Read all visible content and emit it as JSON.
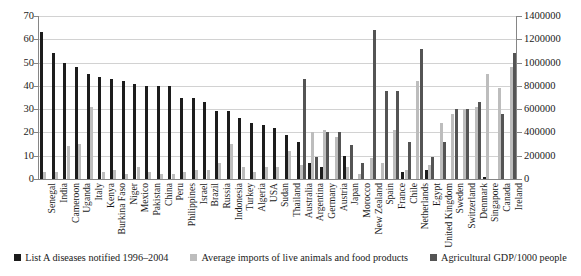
{
  "chart_data": {
    "type": "bar",
    "title": "",
    "xlabel": "",
    "ylabel": "",
    "ylabel_right": "",
    "grid": true,
    "legend_position": "bottom",
    "ylim": [
      0,
      70
    ],
    "ylim_right": [
      0,
      1400000
    ],
    "yticks": [
      "0",
      "10",
      "20",
      "30",
      "40",
      "50",
      "60",
      "70"
    ],
    "yticks_right": [
      "0",
      "200000",
      "400000",
      "600000",
      "800000",
      "1000000",
      "1200000",
      "1400000"
    ],
    "categories": [
      "Senegal",
      "India",
      "Cameroon",
      "Uganda",
      "Italy",
      "Kenya",
      "Burkina Faso",
      "Niger",
      "Mexico",
      "Pakistan",
      "China",
      "Peru",
      "Philippines",
      "Israel",
      "Brazil",
      "Russia",
      "Indonesia",
      "Turkey",
      "Algeria",
      "USA",
      "Sudan",
      "Thailand",
      "Australia",
      "Argentina",
      "Germany",
      "Austria",
      "Japan",
      "Morocco",
      "New Zealand",
      "Spain",
      "France",
      "Chile",
      "Netherlands",
      "Egypt",
      "United Kingdom",
      "Sweden",
      "Switzerland",
      "Denmark",
      "Singapore",
      "Canada",
      "Ireland"
    ],
    "series": [
      {
        "name": "List A diseases notified 1996–2004",
        "color": "#1c1c1c",
        "axis": "left",
        "values": [
          63,
          54,
          50,
          48,
          45,
          44,
          43,
          42,
          41,
          40,
          40,
          40,
          35,
          35,
          33,
          29,
          29,
          26,
          24,
          23,
          22,
          19,
          16,
          7,
          5,
          0,
          10,
          0,
          0,
          0,
          0,
          3,
          0,
          4,
          0,
          0,
          0,
          0,
          1,
          0,
          0
        ]
      },
      {
        "name": "Average imports of live animals and food products",
        "color": "#bdbdbd",
        "axis": "left",
        "values": [
          3,
          3,
          14,
          15,
          31,
          3,
          4,
          2,
          5,
          3,
          2,
          2,
          3,
          4,
          4,
          7,
          15,
          5,
          3,
          5,
          5,
          12,
          6,
          20,
          21,
          18,
          5,
          2,
          9,
          7,
          21,
          4,
          42,
          6,
          24,
          28,
          30,
          31,
          45,
          39,
          48
        ]
      },
      {
        "name": "Agricultural GDP/1000 people",
        "color": "#545454",
        "axis": "right",
        "values": [
          null,
          null,
          null,
          null,
          null,
          null,
          null,
          null,
          null,
          null,
          null,
          null,
          null,
          null,
          null,
          null,
          null,
          null,
          null,
          null,
          null,
          null,
          860000,
          190000,
          400000,
          400000,
          290000,
          140000,
          1280000,
          760000,
          760000,
          320000,
          1120000,
          190000,
          320000,
          600000,
          600000,
          660000,
          null,
          560000,
          1080000
        ]
      }
    ]
  },
  "legend": {
    "items": [
      {
        "label": "List A diseases notified 1996–2004",
        "color": "#1c1c1c"
      },
      {
        "label": "Average imports of live animals and food products",
        "color": "#bdbdbd"
      },
      {
        "label": "Agricultural GDP/1000 people",
        "color": "#545454"
      }
    ]
  }
}
